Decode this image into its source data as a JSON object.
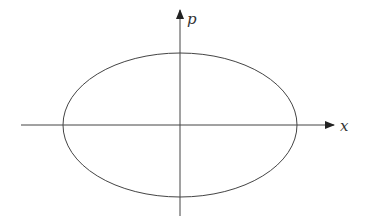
{
  "diagram": {
    "title": "",
    "axes": {
      "horizontal": {
        "label": "x"
      },
      "vertical": {
        "label": "p"
      }
    },
    "shape": {
      "type": "ellipse",
      "center": [
        180,
        125
      ],
      "rx": 117,
      "ry": 72
    },
    "colors": {
      "stroke": "#444444",
      "background": "#ffffff"
    }
  }
}
